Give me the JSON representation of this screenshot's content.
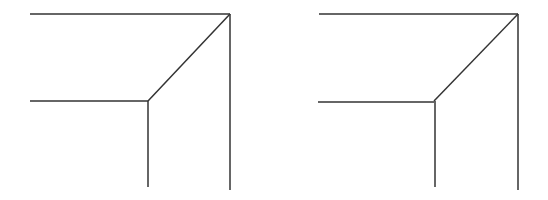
{
  "page": {
    "width": 548,
    "height": 200,
    "background_color": "#ffffff"
  },
  "drawing": {
    "stroke_color": "#333333",
    "stroke_width": 1.5,
    "figure_count": 2,
    "description": "Two similar line drawings of an inside corner / concave corner wireframe, each made of five straight segments"
  },
  "figures": [
    {
      "id": "left-figure",
      "label": "left",
      "segments": [
        {
          "name": "top-horizontal-edge",
          "x1": 30,
          "y1": 14,
          "x2": 230,
          "y2": 14
        },
        {
          "name": "right-vertical-edge",
          "x1": 230,
          "y1": 14,
          "x2": 230,
          "y2": 190
        },
        {
          "name": "diagonal-edge",
          "x1": 230,
          "y1": 14,
          "x2": 148,
          "y2": 101
        },
        {
          "name": "mid-horizontal-edge",
          "x1": 30,
          "y1": 101,
          "x2": 148,
          "y2": 101
        },
        {
          "name": "center-vertical-edge",
          "x1": 148,
          "y1": 101,
          "x2": 148,
          "y2": 187
        }
      ],
      "junction": {
        "name": "corner-junction",
        "x": 148,
        "y": 101
      },
      "apex": {
        "name": "top-right-apex",
        "x": 230,
        "y": 14
      }
    },
    {
      "id": "right-figure",
      "label": "right",
      "segments": [
        {
          "name": "top-horizontal-edge",
          "x1": 319,
          "y1": 14,
          "x2": 518,
          "y2": 14
        },
        {
          "name": "right-vertical-edge",
          "x1": 518,
          "y1": 14,
          "x2": 518,
          "y2": 190
        },
        {
          "name": "diagonal-edge",
          "x1": 518,
          "y1": 14,
          "x2": 434,
          "y2": 101
        },
        {
          "name": "mid-horizontal-edge",
          "x1": 318,
          "y1": 102,
          "x2": 434,
          "y2": 102
        },
        {
          "name": "center-vertical-edge",
          "x1": 435,
          "y1": 101,
          "x2": 435,
          "y2": 187
        }
      ],
      "junction": {
        "name": "corner-junction",
        "x": 434,
        "y": 101
      },
      "apex": {
        "name": "top-right-apex",
        "x": 518,
        "y": 14
      }
    }
  ]
}
